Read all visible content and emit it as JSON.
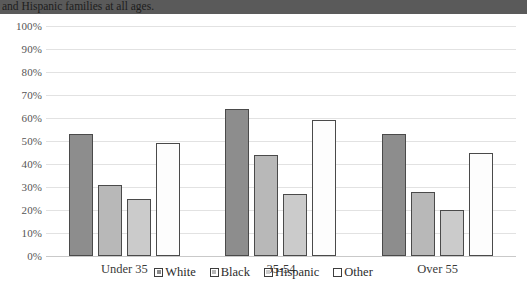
{
  "caption": {
    "text": "and Hispanic families at all ages."
  },
  "chart_data": {
    "type": "bar",
    "title": "",
    "xlabel": "",
    "ylabel": "",
    "ylim": [
      0,
      100
    ],
    "ytick_labels": [
      "100%",
      "90%",
      "80%",
      "70%",
      "60%",
      "50%",
      "40%",
      "30%",
      "20%",
      "10%",
      "0%"
    ],
    "ytick_values": [
      100,
      90,
      80,
      70,
      60,
      50,
      40,
      30,
      20,
      10,
      0
    ],
    "grid": true,
    "legend_position": "bottom",
    "categories": [
      "Under 35",
      "35-54",
      "Over 55"
    ],
    "series": [
      {
        "name": "White",
        "color": "#8d8d8d",
        "values": [
          53,
          64,
          53
        ]
      },
      {
        "name": "Black",
        "color": "#b8b8b8",
        "values": [
          31,
          44,
          28
        ]
      },
      {
        "name": "Hispanic",
        "color": "#cbcbcb",
        "values": [
          25,
          27,
          20
        ]
      },
      {
        "name": "Other",
        "color": "#fdfdfd",
        "values": [
          49,
          59,
          45
        ]
      }
    ]
  }
}
